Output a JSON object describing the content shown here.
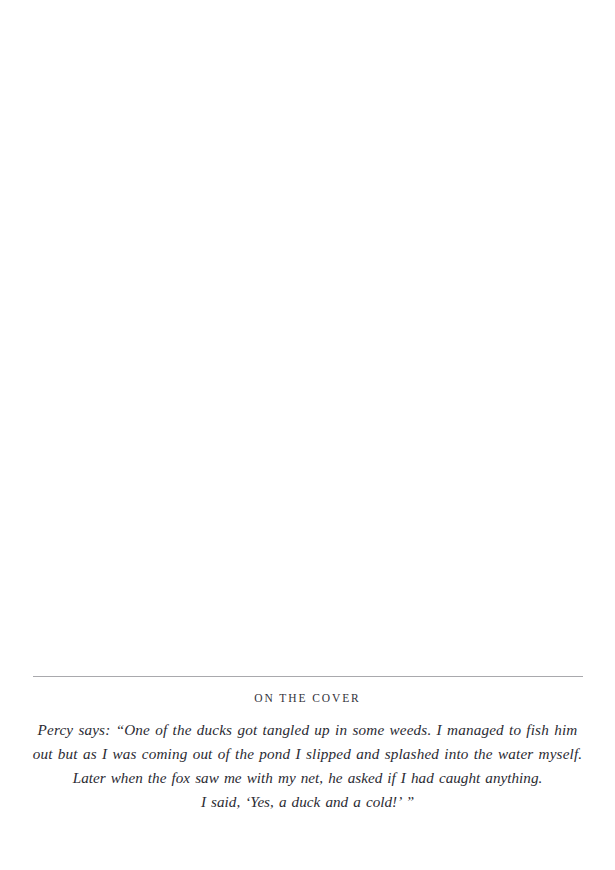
{
  "page": {
    "background_color": "#ffffff",
    "text_color": "#2b2b33",
    "rule_color": "#a9a9ad"
  },
  "cover_note": {
    "heading": "ON THE COVER",
    "quote_lines": [
      "Percy says: “One of the ducks got tangled up in some weeds. I managed to fish him",
      "out but as I was coming out of the pond I slipped and splashed into the water myself.",
      "Later when the fox saw me with my net, he asked if I had caught anything.",
      "I said, ‘Yes, a duck and a cold!’ ”"
    ]
  }
}
